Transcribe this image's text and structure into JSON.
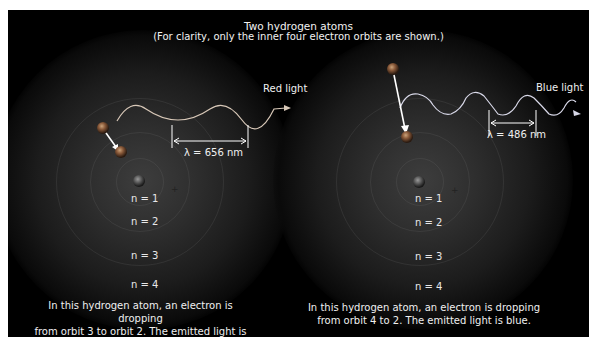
{
  "title": "Two hydrogen atoms",
  "subtitle": "(For clarity, only the inner four electron orbits are shown.)",
  "atoms": [
    {
      "light_label": "Red light",
      "wavelength_label": "λ = 656 nm",
      "orbit_labels": [
        "n = 1",
        "n = 2",
        "n = 3",
        "n = 4"
      ],
      "caption_line1": "In this hydrogen atom, an electron is dropping",
      "caption_line2": "from orbit 3 to orbit 2. The emitted light is red.",
      "nucleus_symbol": "+"
    },
    {
      "light_label": "Blue light",
      "wavelength_label": "λ = 486 nm",
      "orbit_labels": [
        "n = 1",
        "n = 2",
        "n = 3",
        "n = 4"
      ],
      "caption_line1": "In this hydrogen atom, an electron is dropping",
      "caption_line2": "from orbit 4 to 2. The emitted light is blue.",
      "nucleus_symbol": "+"
    }
  ]
}
